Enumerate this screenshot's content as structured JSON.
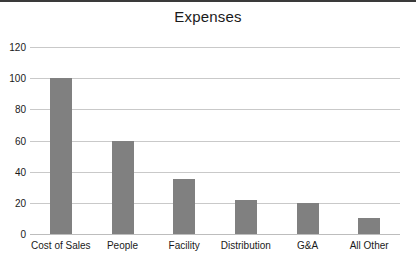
{
  "chart_data": {
    "type": "bar",
    "title": "Expenses",
    "xlabel": "",
    "ylabel": "",
    "categories": [
      "Cost of Sales",
      "People",
      "Facility",
      "Distribution",
      "G&A",
      "All Other"
    ],
    "values": [
      100,
      60,
      35,
      22,
      20,
      10
    ],
    "ylim": [
      0,
      120
    ],
    "yticks": [
      0,
      20,
      40,
      60,
      80,
      100,
      120
    ],
    "ytick_labels": [
      "0",
      "20",
      "40",
      "60",
      "80",
      "100",
      "120"
    ],
    "grid": true,
    "legend": false,
    "legend_position": "none",
    "bar_color": "#808080",
    "gridline_color": "#c9c9c9",
    "background_color": "#ffffff",
    "title_color": "#1a1a1a",
    "frame_rule_color": "#3a3a3a"
  }
}
